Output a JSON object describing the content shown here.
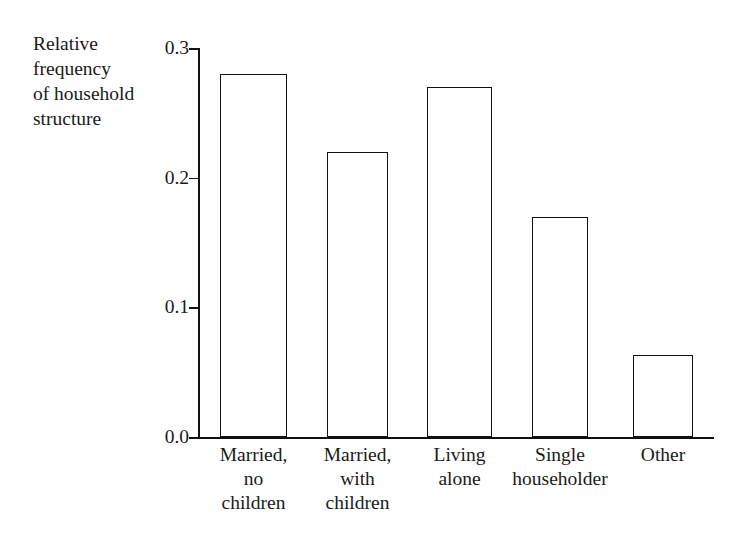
{
  "chart_data": {
    "type": "bar",
    "title": "",
    "subtitle": "",
    "ylabel": "Relative\nfrequency\nof household\nstructure",
    "xlabel": "",
    "categories": [
      "Married,\nno\nchildren",
      "Married,\nwith\nchildren",
      "Living\nalone",
      "Single\nhouseholder",
      "Other"
    ],
    "values": [
      0.28,
      0.22,
      0.27,
      0.17,
      0.063
    ],
    "ylim": [
      0.0,
      0.3
    ],
    "yticks": [
      "0.0",
      "0.1",
      "0.2",
      "0.3"
    ],
    "ytick_values": [
      0.0,
      0.1,
      0.2,
      0.3
    ],
    "grid": false,
    "legend": null,
    "bar_fill_color": "#ffffff",
    "bar_edge_color": "#111111",
    "axis_color": "#111111",
    "background_color": "#ffffff"
  },
  "figure": {
    "name": "relative-frequency-of-household-structure-bar-chart"
  }
}
